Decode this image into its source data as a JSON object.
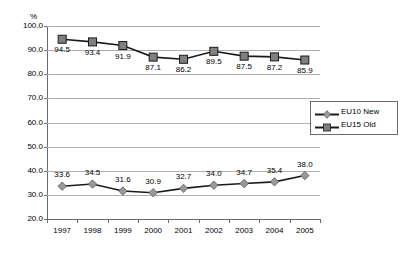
{
  "chart_data": {
    "type": "line",
    "title": "",
    "subtitle": "",
    "xlabel": "",
    "ylabel": "%",
    "unit_label": "%",
    "categories": [
      "1997",
      "1998",
      "1999",
      "2000",
      "2001",
      "2002",
      "2003",
      "2004",
      "2005"
    ],
    "ylim": [
      20.0,
      100.0
    ],
    "ytick_labels": [
      "100.0",
      "90.0",
      "80.0",
      "70.0",
      "60.0",
      "50.0",
      "40.0",
      "30.0",
      "20.0"
    ],
    "ytick_values": [
      100.0,
      90.0,
      80.0,
      70.0,
      60.0,
      50.0,
      40.0,
      30.0,
      20.0
    ],
    "grid": true,
    "legend_position": "right",
    "series": [
      {
        "name": "EU10 New",
        "marker": "diamond",
        "color": "#999999",
        "line_color": "#1a1a1a",
        "values": [
          33.6,
          34.5,
          31.6,
          30.9,
          32.7,
          34.0,
          34.7,
          35.4,
          38.0
        ],
        "labels": [
          "33.6",
          "34.5",
          "31.6",
          "30.9",
          "32.7",
          "34.0",
          "34.7",
          "35.4",
          "38.0"
        ],
        "label_position": "above"
      },
      {
        "name": "EU15 Old",
        "marker": "square",
        "color": "#808080",
        "line_color": "#1a1a1a",
        "values": [
          94.5,
          93.4,
          91.9,
          87.1,
          86.2,
          89.5,
          87.5,
          87.2,
          85.9
        ],
        "labels": [
          "94.5",
          "93.4",
          "91.9",
          "87.1",
          "86.2",
          "89.5",
          "87.5",
          "87.2",
          "85.9"
        ],
        "label_position": "below"
      }
    ]
  },
  "legend": {
    "items": [
      {
        "label": "EU10 New",
        "marker": "diamond"
      },
      {
        "label": "EU15 Old",
        "marker": "square"
      }
    ]
  }
}
